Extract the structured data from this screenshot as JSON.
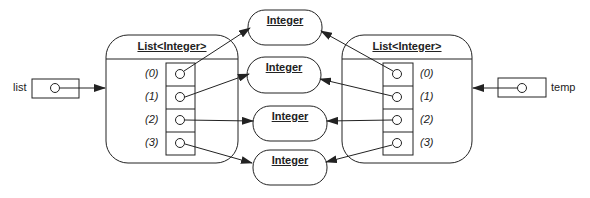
{
  "diagram": {
    "type": "object-reference-diagram",
    "variables": [
      {
        "name": "list",
        "points_to": "left_list"
      },
      {
        "name": "temp",
        "points_to": "right_list"
      }
    ],
    "left_list": {
      "title": "List<Integer>",
      "indices": [
        "(0)",
        "(1)",
        "(2)",
        "(3)"
      ]
    },
    "right_list": {
      "title": "List<Integer>",
      "indices": [
        "(0)",
        "(1)",
        "(2)",
        "(3)"
      ]
    },
    "integers": [
      {
        "label": "Integer"
      },
      {
        "label": "Integer"
      },
      {
        "label": "Integer"
      },
      {
        "label": "Integer"
      }
    ],
    "edges": [
      {
        "from": "list",
        "to": "left_list"
      },
      {
        "from": "temp",
        "to": "right_list"
      },
      {
        "from": "left_list[0]",
        "to": "integer_1"
      },
      {
        "from": "left_list[1]",
        "to": "integer_2"
      },
      {
        "from": "left_list[2]",
        "to": "integer_3"
      },
      {
        "from": "left_list[3]",
        "to": "integer_4"
      },
      {
        "from": "right_list[0]",
        "to": "integer_1"
      },
      {
        "from": "right_list[1]",
        "to": "integer_2"
      },
      {
        "from": "right_list[2]",
        "to": "integer_3"
      },
      {
        "from": "right_list[3]",
        "to": "integer_4"
      }
    ],
    "colors": {
      "stroke": "#222222",
      "background": "#ffffff"
    }
  }
}
